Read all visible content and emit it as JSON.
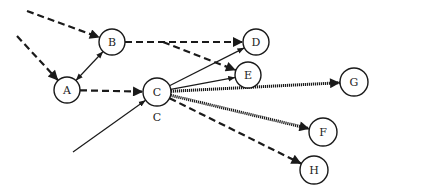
{
  "diagram": {
    "type": "directed-graph",
    "colors": {
      "stroke": "#1a1a1a",
      "background": "#ffffff",
      "node_fill": "#ffffff"
    },
    "nodes": [
      {
        "id": "A",
        "label": "A",
        "x": 67,
        "y": 90,
        "r": 13
      },
      {
        "id": "B",
        "label": "B",
        "x": 112,
        "y": 42,
        "r": 13
      },
      {
        "id": "C",
        "label": "C",
        "x": 157,
        "y": 92,
        "r": 14
      },
      {
        "id": "D",
        "label": "D",
        "x": 256,
        "y": 42,
        "r": 13
      },
      {
        "id": "E",
        "label": "E",
        "x": 248,
        "y": 75,
        "r": 13
      },
      {
        "id": "G",
        "label": "G",
        "x": 354,
        "y": 82,
        "r": 14
      },
      {
        "id": "F",
        "label": "F",
        "x": 323,
        "y": 132,
        "r": 14
      },
      {
        "id": "H",
        "label": "H",
        "x": 314,
        "y": 170,
        "r": 14
      }
    ],
    "annotations": [
      {
        "text": "C",
        "x": 157,
        "y": 121
      }
    ],
    "edges": [
      {
        "from": "external",
        "to": "B",
        "style": "dashed",
        "x1": 27,
        "y1": 11
      },
      {
        "from": "external",
        "to": "A",
        "style": "dashed",
        "x1": 17,
        "y1": 36
      },
      {
        "from": "A",
        "to": "B",
        "style": "solid",
        "bidirectional": true
      },
      {
        "from": "A",
        "to": "C",
        "style": "dashed"
      },
      {
        "from": "B",
        "to": "D",
        "style": "dashed"
      },
      {
        "from": "B-D",
        "to": "E",
        "style": "dashed",
        "x1": 163,
        "y1": 42
      },
      {
        "from": "C",
        "to": "D",
        "style": "solid"
      },
      {
        "from": "C",
        "to": "E",
        "style": "solid"
      },
      {
        "from": "C",
        "to": "G",
        "style": "thick-dotted"
      },
      {
        "from": "C",
        "to": "F",
        "style": "thick-dotted"
      },
      {
        "from": "C",
        "to": "H",
        "style": "dashed"
      },
      {
        "from": "external",
        "to": "C",
        "style": "solid",
        "x1": 73,
        "y1": 152
      }
    ]
  }
}
